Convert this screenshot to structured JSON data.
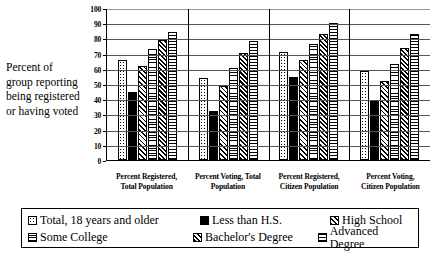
{
  "y_axis_caption": "Percent of group reporting being registered or having voted",
  "chart_data": {
    "type": "bar",
    "title": "",
    "xlabel": "",
    "ylabel": "Percent of group reporting being registered or having voted",
    "ylim": [
      0,
      100
    ],
    "yticks": [
      0,
      10,
      20,
      30,
      40,
      50,
      60,
      70,
      80,
      90,
      100
    ],
    "ytick_labels": [
      "0",
      "10",
      "20",
      "30",
      "40",
      "50",
      "60",
      "70",
      "80",
      "90",
      "100"
    ],
    "grid": true,
    "legend_position": "bottom",
    "categories": [
      "Percent Registered, Total Population",
      "Percent Voting, Total Population",
      "Percent Registered, Citizen Population",
      "Percent Voting, Citizen Population"
    ],
    "category_lines": [
      [
        "Percent Registered,",
        "Total Population"
      ],
      [
        "Percent Voting, Total",
        "Population"
      ],
      [
        "Percent Registered,",
        "Citizen Population"
      ],
      [
        "Percent Voting,",
        "Citizen Population"
      ]
    ],
    "series": [
      {
        "name": "Total, 18 years and older",
        "pattern": "dots",
        "values": [
          66,
          54,
          71,
          58.5
        ]
      },
      {
        "name": "Less than H.S.",
        "pattern": "solid",
        "values": [
          45,
          32,
          54.5,
          39.5
        ]
      },
      {
        "name": "High School",
        "pattern": "diagonal",
        "values": [
          62,
          49,
          65.5,
          52
        ]
      },
      {
        "name": "Some College",
        "pattern": "hlines",
        "values": [
          73,
          60.5,
          76,
          63
        ]
      },
      {
        "name": "Bachelor's Degree",
        "pattern": "check",
        "values": [
          79,
          70.5,
          83,
          74
        ]
      },
      {
        "name": "Advanced Degree",
        "pattern": "gridfill",
        "values": [
          84,
          78,
          90,
          83
        ]
      }
    ]
  },
  "legend": {
    "rows": [
      [
        {
          "label": "Total, 18 years and older",
          "pattern": "dots"
        },
        {
          "label": "Less than H.S.",
          "pattern": "solid"
        },
        {
          "label": "High School",
          "pattern": "diagonal"
        }
      ],
      [
        {
          "label": "Some College",
          "pattern": "hlines"
        },
        {
          "label": "Bachelor's Degree",
          "pattern": "check"
        },
        {
          "label": "Advanced Degree",
          "pattern": "gridfill"
        }
      ]
    ]
  }
}
